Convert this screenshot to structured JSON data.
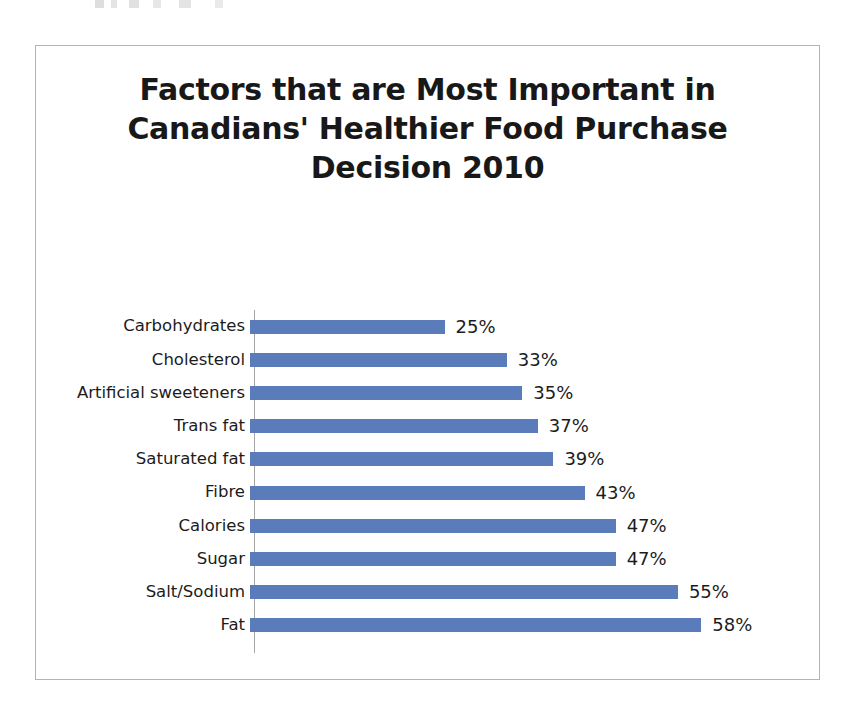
{
  "chart_data": {
    "type": "bar",
    "orientation": "horizontal",
    "title": "Factors that are Most Important in Canadians' Healthier Food Purchase Decision 2010",
    "title_lines": [
      "Factors that are Most Important in",
      "Canadians' Healthier Food Purchase",
      "Decision 2010"
    ],
    "xlabel": "",
    "ylabel": "",
    "xlim": [
      0,
      58
    ],
    "grid": false,
    "legend": "none",
    "value_suffix": "%",
    "bar_color": "#5b7cba",
    "axis_color": "#a6a6a6",
    "border_color": "#b4b4b4",
    "text_color": "#1c1c1c",
    "categories": [
      "Carbohydrates",
      "Cholesterol",
      "Artificial sweeteners",
      "Trans fat",
      "Saturated fat",
      "Fibre",
      "Calories",
      "Sugar",
      "Salt/Sodium",
      "Fat"
    ],
    "values": [
      25,
      33,
      35,
      37,
      39,
      43,
      47,
      47,
      55,
      58
    ],
    "value_labels": [
      "25%",
      "33%",
      "35%",
      "37%",
      "39%",
      "43%",
      "47%",
      "47%",
      "55%",
      "58%"
    ],
    "rows": [
      {
        "category": "Carbohydrates",
        "value": 25,
        "label": "25%"
      },
      {
        "category": "Cholesterol",
        "value": 33,
        "label": "33%"
      },
      {
        "category": "Artificial sweeteners",
        "value": 35,
        "label": "35%"
      },
      {
        "category": "Trans fat",
        "value": 37,
        "label": "37%"
      },
      {
        "category": "Saturated fat",
        "value": 39,
        "label": "39%"
      },
      {
        "category": "Fibre",
        "value": 43,
        "label": "43%"
      },
      {
        "category": "Calories",
        "value": 47,
        "label": "47%"
      },
      {
        "category": "Sugar",
        "value": 47,
        "label": "47%"
      },
      {
        "category": "Salt/Sodium",
        "value": 55,
        "label": "55%"
      },
      {
        "category": "Fat",
        "value": 58,
        "label": "58%"
      }
    ]
  }
}
